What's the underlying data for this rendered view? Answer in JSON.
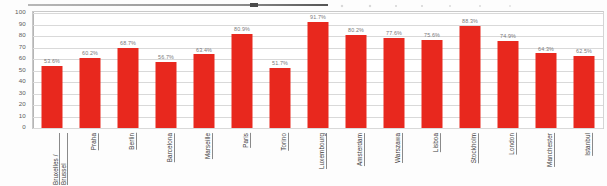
{
  "chart_data": {
    "type": "bar",
    "title": "",
    "subtitle": "",
    "xlabel": "",
    "ylabel": "",
    "ylim": [
      0,
      100
    ],
    "yticks": [
      100,
      90,
      80,
      70,
      60,
      50,
      40,
      30,
      20,
      10,
      0
    ],
    "grid": true,
    "legend": "none",
    "value_suffix": "%",
    "bar_color": "#e8281e",
    "categories": [
      "Bruxelles / Brussel",
      "Praha",
      "Berlin",
      "Barcelona",
      "Marseille",
      "Paris",
      "Torino",
      "Luxembourg",
      "Amsterdam",
      "Warszawa",
      "Lisboa",
      "Stockholm",
      "London",
      "Manchester",
      "Istanbul"
    ],
    "values": [
      53.6,
      60.2,
      68.7,
      56.7,
      63.4,
      80.9,
      51.7,
      91.7,
      80.2,
      77.6,
      75.6,
      88.3,
      74.9,
      64.3,
      62.5
    ],
    "data_labels": [
      "53.6%",
      "60.2%",
      "68.7%",
      "56.7%",
      "63.4%",
      "80.9%",
      "51.7%",
      "91.7%",
      "80.2%",
      "77.6%",
      "75.6%",
      "88.3%",
      "74.9%",
      "64.3%",
      "62.5%"
    ]
  },
  "axis": {
    "y_tick_labels": [
      "100",
      "90",
      "80",
      "70",
      "60",
      "50",
      "40",
      "30",
      "20",
      "10",
      "0"
    ]
  }
}
